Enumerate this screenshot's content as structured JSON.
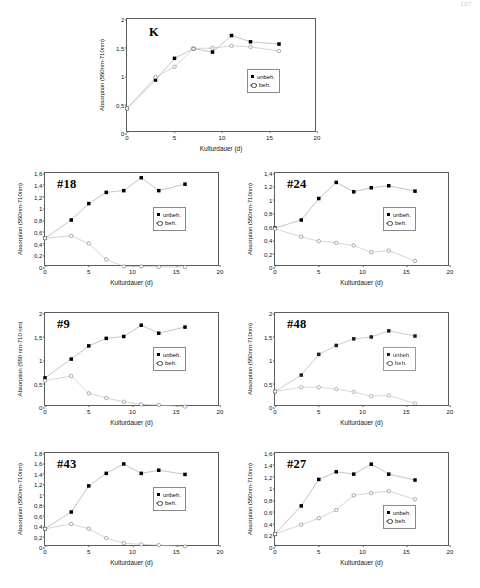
{
  "folio": "107",
  "axis_titles": {
    "x": "Kulturdauer (d)",
    "y_compact": "Absorption (550nm-710nm)",
    "y_spaced": "Absorption (550 nm-710 nm)"
  },
  "legend": {
    "untreated": "unbeh.",
    "treated": "beh.",
    "untreated_marker": "filled-square-icon",
    "treated_marker": "open-circle-icon"
  },
  "colors": {
    "axis": "#5d5d5d",
    "marker_untreated": "#000000",
    "marker_treated": "#ffffff",
    "line": "#b9b9b9",
    "text": "#151515"
  },
  "chart_data": [
    {
      "id": "K",
      "type": "line",
      "title": "K",
      "xlabel": "Kulturdauer (d)",
      "ylabel": "Absorption (550nm-710nm)",
      "xlim": [
        0,
        20
      ],
      "ylim": [
        0,
        2
      ],
      "xticks": [
        0,
        5,
        10,
        15,
        20
      ],
      "yticks": [
        0,
        0.5,
        1,
        1.5,
        2
      ],
      "ytick_labels": [
        "0",
        "0,5",
        "1",
        "1,5",
        "2"
      ],
      "xtick_labels": [
        "0",
        "5",
        "10",
        "15",
        "20"
      ],
      "grid": false,
      "legend_position": "right-middle",
      "x": [
        0,
        3,
        5,
        7,
        9,
        11,
        13,
        16
      ],
      "series": [
        {
          "name": "unbeh.",
          "values": [
            0.43,
            0.93,
            1.31,
            1.48,
            1.42,
            1.71,
            1.6,
            1.56
          ]
        },
        {
          "name": "beh.",
          "values": [
            0.43,
            0.98,
            1.16,
            1.48,
            1.49,
            1.53,
            1.51,
            1.44
          ]
        }
      ]
    },
    {
      "id": "#18",
      "type": "line",
      "title": "#18",
      "xlabel": "Kulturdauer (d)",
      "ylabel": "Absorption (550nm-710nm)",
      "xlim": [
        0,
        20
      ],
      "ylim": [
        0,
        1.6
      ],
      "xticks": [
        0,
        5,
        10,
        15,
        20
      ],
      "yticks": [
        0,
        0.2,
        0.4,
        0.6,
        0.8,
        1,
        1.2,
        1.4,
        1.6
      ],
      "ytick_labels": [
        "0",
        "0,2",
        "0,4",
        "0,6",
        "0,8",
        "1",
        "1,2",
        "1,4",
        "1,6"
      ],
      "xtick_labels": [
        "0",
        "5",
        "10",
        "15",
        "20"
      ],
      "grid": false,
      "legend_position": "right-middle",
      "x": [
        0,
        3,
        5,
        7,
        9,
        11,
        13,
        16
      ],
      "series": [
        {
          "name": "unbeh.",
          "values": [
            0.49,
            0.8,
            1.08,
            1.27,
            1.3,
            1.52,
            1.3,
            1.41
          ]
        },
        {
          "name": "beh.",
          "values": [
            0.49,
            0.53,
            0.4,
            0.13,
            0.01,
            0.01,
            0.0,
            0.0
          ]
        }
      ]
    },
    {
      "id": "#24",
      "type": "line",
      "title": "#24",
      "xlabel": "Kulturdauer (d)",
      "ylabel": "Absorption (550nm-710nm)",
      "xlim": [
        0,
        20
      ],
      "ylim": [
        0,
        1.4
      ],
      "xticks": [
        0,
        5,
        10,
        15,
        20
      ],
      "yticks": [
        0,
        0.2,
        0.4,
        0.6,
        0.8,
        1,
        1.2,
        1.4
      ],
      "ytick_labels": [
        "0",
        "0,2",
        "0,4",
        "0,6",
        "0,8",
        "1",
        "1,2",
        "1,4"
      ],
      "xtick_labels": [
        "0",
        "5",
        "10",
        "15",
        "20"
      ],
      "grid": false,
      "legend_position": "right-middle",
      "x": [
        0,
        3,
        5,
        7,
        9,
        11,
        13,
        16
      ],
      "series": [
        {
          "name": "unbeh.",
          "values": [
            0.58,
            0.7,
            1.02,
            1.26,
            1.12,
            1.18,
            1.21,
            1.13
          ]
        },
        {
          "name": "beh.",
          "values": [
            0.57,
            0.45,
            0.385,
            0.36,
            0.32,
            0.22,
            0.245,
            0.09
          ]
        }
      ]
    },
    {
      "id": "#9",
      "type": "line",
      "title": "#9",
      "xlabel": "Kulturdauer (d)",
      "ylabel": "Absorption (550 nm-710 nm)",
      "xlim": [
        0,
        20
      ],
      "ylim": [
        0,
        2
      ],
      "xticks": [
        0,
        5,
        10,
        15,
        20
      ],
      "yticks": [
        0,
        0.5,
        1,
        1.5,
        2
      ],
      "ytick_labels": [
        "0",
        "0,5",
        "1",
        "1,5",
        "2"
      ],
      "xtick_labels": [
        "0",
        "5",
        "10",
        "15",
        "20"
      ],
      "grid": false,
      "legend_position": "right-middle",
      "x": [
        0,
        3,
        5,
        7,
        9,
        11,
        13,
        16
      ],
      "series": [
        {
          "name": "unbeh.",
          "values": [
            0.62,
            1.02,
            1.3,
            1.46,
            1.5,
            1.74,
            1.57,
            1.7
          ]
        },
        {
          "name": "beh.",
          "values": [
            0.56,
            0.66,
            0.29,
            0.19,
            0.11,
            0.055,
            0.04,
            0.01
          ]
        }
      ]
    },
    {
      "id": "#48",
      "type": "line",
      "title": "#48",
      "xlabel": "Kulturdauer (d)",
      "ylabel": "Absorption (550nm-710nm)",
      "xlim": [
        0,
        20
      ],
      "ylim": [
        0,
        2
      ],
      "xticks": [
        0,
        5,
        10,
        15,
        20
      ],
      "yticks": [
        0,
        0.5,
        1,
        1.5,
        2
      ],
      "ytick_labels": [
        "0",
        "0,5",
        "1",
        "1,5",
        "2"
      ],
      "xtick_labels": [
        "0",
        "5",
        "10",
        "15",
        "20"
      ],
      "grid": false,
      "legend_position": "right-middle",
      "x": [
        0,
        3,
        5,
        7,
        9,
        11,
        13,
        16
      ],
      "series": [
        {
          "name": "unbeh.",
          "values": [
            0.33,
            0.68,
            1.12,
            1.31,
            1.45,
            1.49,
            1.62,
            1.51
          ]
        },
        {
          "name": "beh.",
          "values": [
            0.33,
            0.42,
            0.42,
            0.38,
            0.32,
            0.23,
            0.245,
            0.075
          ]
        }
      ]
    },
    {
      "id": "#43",
      "type": "line",
      "title": "#43",
      "xlabel": "Kulturdauer (d)",
      "ylabel": "Absorption (550nm-710nm)",
      "xlim": [
        0,
        20
      ],
      "ylim": [
        0,
        1.8
      ],
      "xticks": [
        0,
        5,
        10,
        15,
        20
      ],
      "yticks": [
        0,
        0.2,
        0.4,
        0.6,
        0.8,
        1,
        1.2,
        1.4,
        1.6,
        1.8
      ],
      "ytick_labels": [
        "0",
        "0,2",
        "0,4",
        "0,6",
        "0,8",
        "1",
        "1,2",
        "1,4",
        "1,6",
        "1,8"
      ],
      "xtick_labels": [
        "0",
        "5",
        "10",
        "15",
        "20"
      ],
      "grid": false,
      "legend_position": "right-middle",
      "x": [
        0,
        3,
        5,
        7,
        9,
        11,
        13,
        16
      ],
      "series": [
        {
          "name": "unbeh.",
          "values": [
            0.35,
            0.67,
            1.17,
            1.41,
            1.59,
            1.41,
            1.47,
            1.39
          ]
        },
        {
          "name": "beh.",
          "values": [
            0.35,
            0.44,
            0.35,
            0.17,
            0.075,
            0.05,
            0.035,
            0.01
          ]
        }
      ]
    },
    {
      "id": "#27",
      "type": "line",
      "title": "#27",
      "xlabel": "Kulturdauer (d)",
      "ylabel": "Absorption (550nm-710nm)",
      "xlim": [
        0,
        20
      ],
      "ylim": [
        0,
        1.6
      ],
      "xticks": [
        0,
        5,
        10,
        15,
        20
      ],
      "yticks": [
        0,
        0.2,
        0.4,
        0.6,
        0.8,
        1,
        1.2,
        1.4,
        1.6
      ],
      "ytick_labels": [
        "0",
        "0,2",
        "0,4",
        "0,6",
        "0,8",
        "1",
        "1,2",
        "1,4",
        "1,6"
      ],
      "xtick_labels": [
        "0",
        "5",
        "10",
        "15",
        "20"
      ],
      "grid": false,
      "legend_position": "right-bottom",
      "x": [
        0,
        3,
        5,
        7,
        9,
        11,
        13,
        16
      ],
      "series": [
        {
          "name": "unbeh.",
          "values": [
            0.22,
            0.7,
            1.15,
            1.28,
            1.24,
            1.41,
            1.24,
            1.14
          ]
        },
        {
          "name": "beh.",
          "values": [
            0.22,
            0.38,
            0.49,
            0.63,
            0.88,
            0.92,
            0.95,
            0.81
          ]
        }
      ]
    }
  ]
}
